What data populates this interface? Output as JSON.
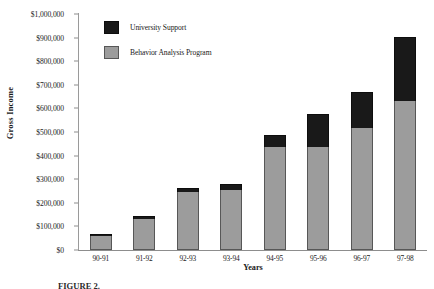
{
  "chart_data": {
    "type": "bar",
    "stacked": true,
    "title": "",
    "xlabel": "Years",
    "ylabel": "Gross Income",
    "categories": [
      "90-91",
      "91-92",
      "92-93",
      "93-94",
      "94-95",
      "95-96",
      "96-97",
      "97-98"
    ],
    "ylim": [
      0,
      1000000
    ],
    "ytick_values": [
      0,
      100000,
      200000,
      300000,
      400000,
      500000,
      600000,
      700000,
      800000,
      900000,
      1000000
    ],
    "ytick_labels": [
      "$0",
      "$100,000",
      "$200,000",
      "$300,000",
      "$400,000",
      "$500,000",
      "$600,000",
      "$700,000",
      "$800,000",
      "$900,000",
      "$1,000,000"
    ],
    "grid": false,
    "legend_position": "upper left inside",
    "series": [
      {
        "name": "Behavior Analysis Program",
        "color": "#9c9c9c",
        "values": [
          58000,
          130000,
          245000,
          255000,
          437000,
          436000,
          519000,
          632000
        ]
      },
      {
        "name": "University Support",
        "color": "#191919",
        "values": [
          10000,
          15000,
          18000,
          25000,
          50000,
          140000,
          150000,
          270000
        ]
      }
    ],
    "totals": [
      68000,
      145000,
      263000,
      280000,
      487000,
      576000,
      669000,
      902000
    ]
  },
  "legend": {
    "items": [
      {
        "label": "University Support",
        "swatch": "support"
      },
      {
        "label": "Behavior Analysis Program",
        "swatch": "program"
      }
    ]
  },
  "caption": {
    "text": "FIGURE 2."
  },
  "colors": {
    "support": "#191919",
    "program": "#9c9c9c",
    "axis": "#8d8d8d",
    "text": "#1a1a1a"
  }
}
